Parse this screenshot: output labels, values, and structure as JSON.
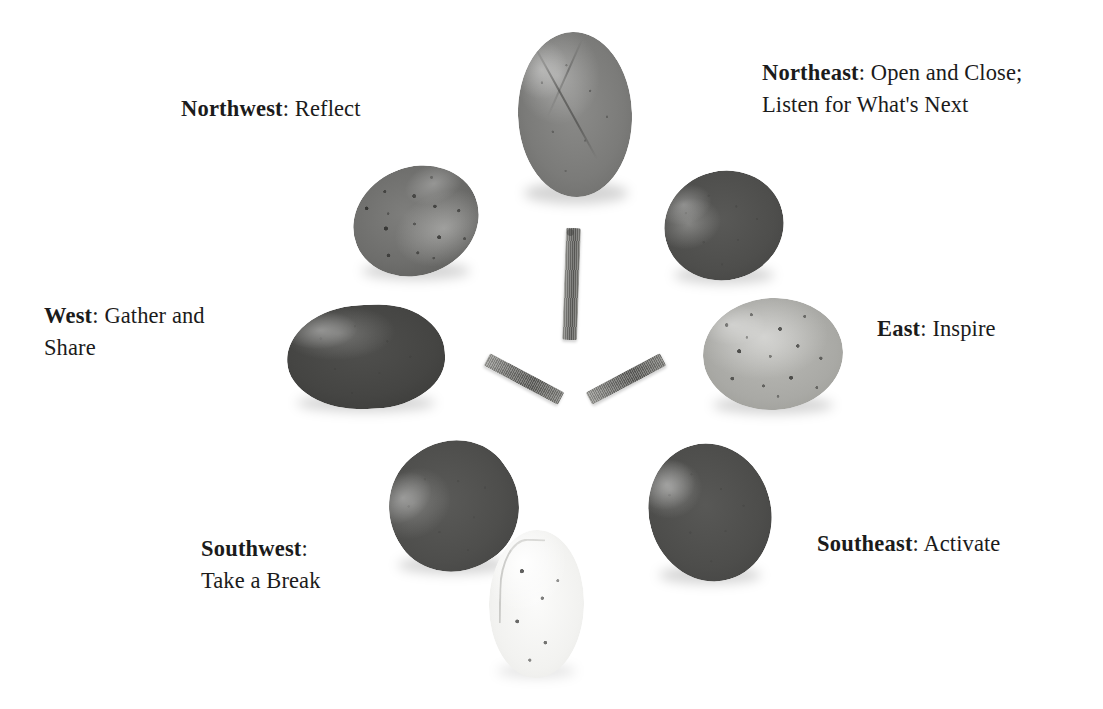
{
  "figure": {
    "arrangement": "radial",
    "center_element": "three-twigs-y-pattern"
  },
  "labels": {
    "northwest": {
      "direction": "Northwest",
      "separator": ": ",
      "text": "Reflect"
    },
    "northeast": {
      "direction": "Northeast",
      "separator": ": ",
      "text": "Open and Close;\nListen for What's Next"
    },
    "west": {
      "direction": "West",
      "separator": ": ",
      "text": "Gather and\nShare"
    },
    "east": {
      "direction": "East",
      "separator": ": ",
      "text": "Inspire"
    },
    "southwest": {
      "direction": "Southwest",
      "separator": ":",
      "text": "\nTake a Break"
    },
    "southeast": {
      "direction": "Southeast",
      "separator": ": ",
      "text": "Activate"
    }
  },
  "stones": {
    "north": {
      "name": "north-stone",
      "tone": "medium-grey",
      "shape": "tall-oval",
      "feature": "diagonal vein"
    },
    "northwest": {
      "name": "northwest-stone",
      "tone": "speckled-grey",
      "shape": "round-oval",
      "feature": "granite speckles"
    },
    "northeast": {
      "name": "northeast-stone",
      "tone": "dark-grey",
      "shape": "round",
      "feature": "smooth"
    },
    "east": {
      "name": "east-stone",
      "tone": "light-grey",
      "shape": "wide-round",
      "feature": "dark flecks"
    },
    "west": {
      "name": "west-stone",
      "tone": "very-dark",
      "shape": "elongated-flat",
      "feature": "smooth"
    },
    "southwest": {
      "name": "southwest-stone",
      "tone": "dark-grey",
      "shape": "tilted-oval",
      "feature": "smooth"
    },
    "southeast": {
      "name": "southeast-stone",
      "tone": "dark-grey",
      "shape": "oval",
      "feature": "smooth"
    },
    "south": {
      "name": "south-stone",
      "tone": "white",
      "shape": "tall-oval",
      "feature": "dark flecks"
    }
  },
  "twigs": {
    "north": {
      "name": "twig-north",
      "orientation": "vertical"
    },
    "southwest": {
      "name": "twig-southwest",
      "orientation": "diagonal-down-left"
    },
    "southeast": {
      "name": "twig-southeast",
      "orientation": "diagonal-down-right"
    }
  },
  "colors": {
    "background": "#ffffff",
    "text": "#1b1b1b",
    "stone_dark": "#4e4e4c",
    "stone_medium": "#7b7b79",
    "stone_light": "#a9a9a5",
    "stone_white": "#f2f2f0",
    "twig": "#737370"
  }
}
